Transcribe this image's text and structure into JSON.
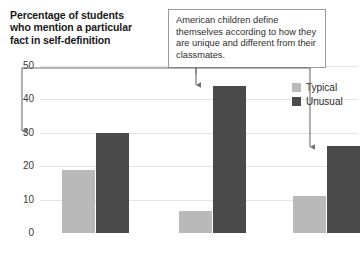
{
  "chart_data": {
    "type": "bar",
    "title": "Percentage of students who mention a particular fact in self-definition",
    "xlabel": "",
    "ylabel": "Percentage of students who mention a particular fact in self-definition",
    "categories": [
      "Age",
      "Place of birth",
      "Gender"
    ],
    "series": [
      {
        "name": "Typical",
        "color": "#b9b9b9",
        "values": [
          19,
          6.5,
          11
        ]
      },
      {
        "name": "Unusual",
        "color": "#4a4a4a",
        "values": [
          30,
          44,
          26
        ]
      }
    ],
    "ylim": [
      0,
      50
    ],
    "yticks": [
      0,
      10,
      20,
      30,
      40,
      50
    ],
    "ytick_labels": [
      "0",
      "10",
      "20",
      "30",
      "40",
      "50"
    ],
    "grid": true,
    "legend_position": "top-right",
    "annotations": [
      {
        "text": "American children define themselves according to how they are unique and different from their classmates.",
        "points_to": [
          "Age / Unusual",
          "Place of birth / Unusual",
          "Gender / Unusual"
        ]
      }
    ]
  },
  "legend": {
    "items": [
      {
        "label": "Typical",
        "color": "#b9b9b9"
      },
      {
        "label": "Unusual",
        "color": "#4a4a4a"
      }
    ]
  },
  "callout": {
    "text": "American children define themselves according to how they are unique and different from their classmates."
  },
  "colors": {
    "typical": "#b9b9b9",
    "unusual": "#4a4a4a",
    "grid": "#e3e3e3",
    "axis": "#3d3d3d",
    "callout_border": "#9a9a9a",
    "leader": "#6f6f6f"
  }
}
